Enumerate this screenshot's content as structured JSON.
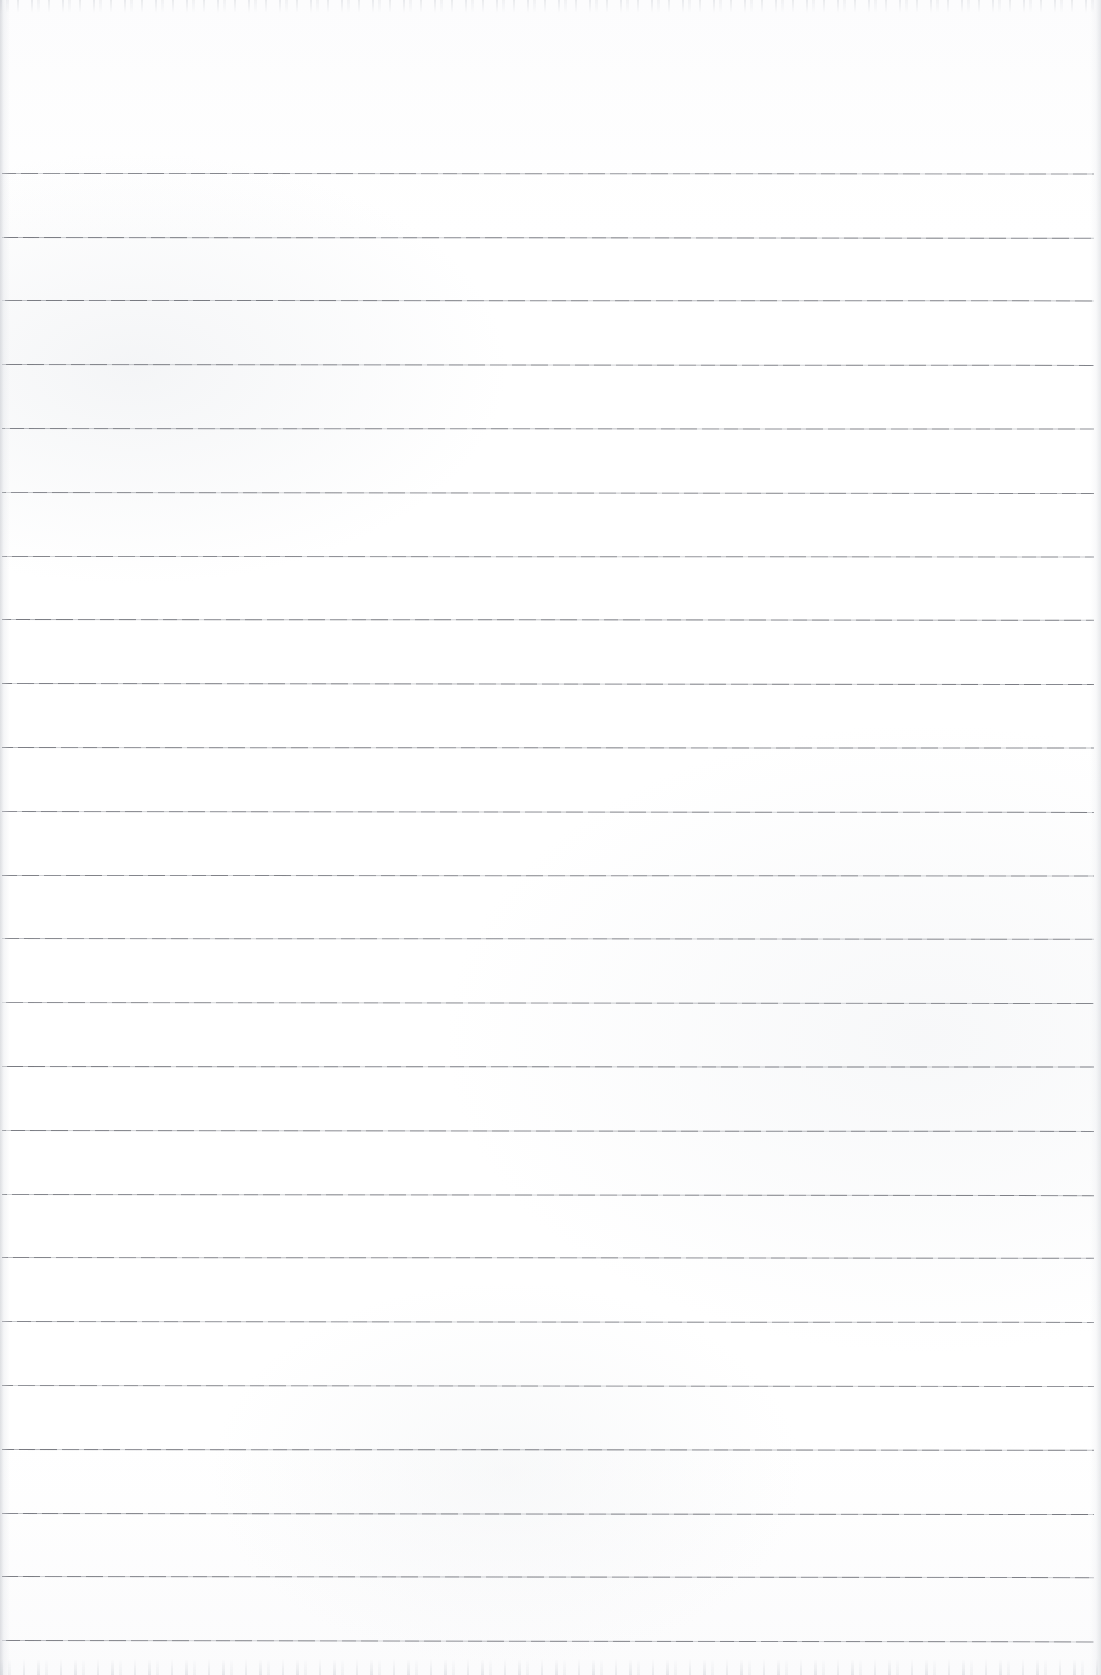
{
  "document": {
    "kind": "scanned-lined-paper",
    "title": "Blank ruled notebook page",
    "page_width": 1101,
    "page_height": 1675,
    "text_content": "",
    "handwriting_present": "no",
    "printed_text_present": "no"
  },
  "paper": {
    "background_color": "#ffffff",
    "tint_color": "#fcfcfd",
    "mottle_color": "#ecedf0",
    "left_edge_shadow_color": "#c4c7cd",
    "right_edge_shadow_color": "#ced1d6",
    "scan_noise_color": "#cdd0d6",
    "top_margin_height": 173
  },
  "ruling": {
    "line_color": "#686a72",
    "line_thickness": 1,
    "line_spacing": 63.8,
    "first_line_y": 173,
    "last_line_y": 1640,
    "line_start_x": 2,
    "line_end_x": 1094,
    "line_count": 24,
    "lines_y": [
      173,
      237,
      300,
      364,
      428,
      492,
      556,
      619,
      683,
      747,
      811,
      875,
      938,
      1002,
      1066,
      1130,
      1194,
      1257,
      1321,
      1385,
      1449,
      1513,
      1576,
      1640
    ],
    "line_slopes_px": [
      0.5,
      0.8,
      0.4,
      0.9,
      0.6,
      1.0,
      0.5,
      0.7,
      1.1,
      0.6,
      0.9,
      0.5,
      0.8,
      1.0,
      0.6,
      0.9,
      1.2,
      0.7,
      0.9,
      1.1,
      0.8,
      1.0,
      1.2,
      1.4
    ]
  }
}
